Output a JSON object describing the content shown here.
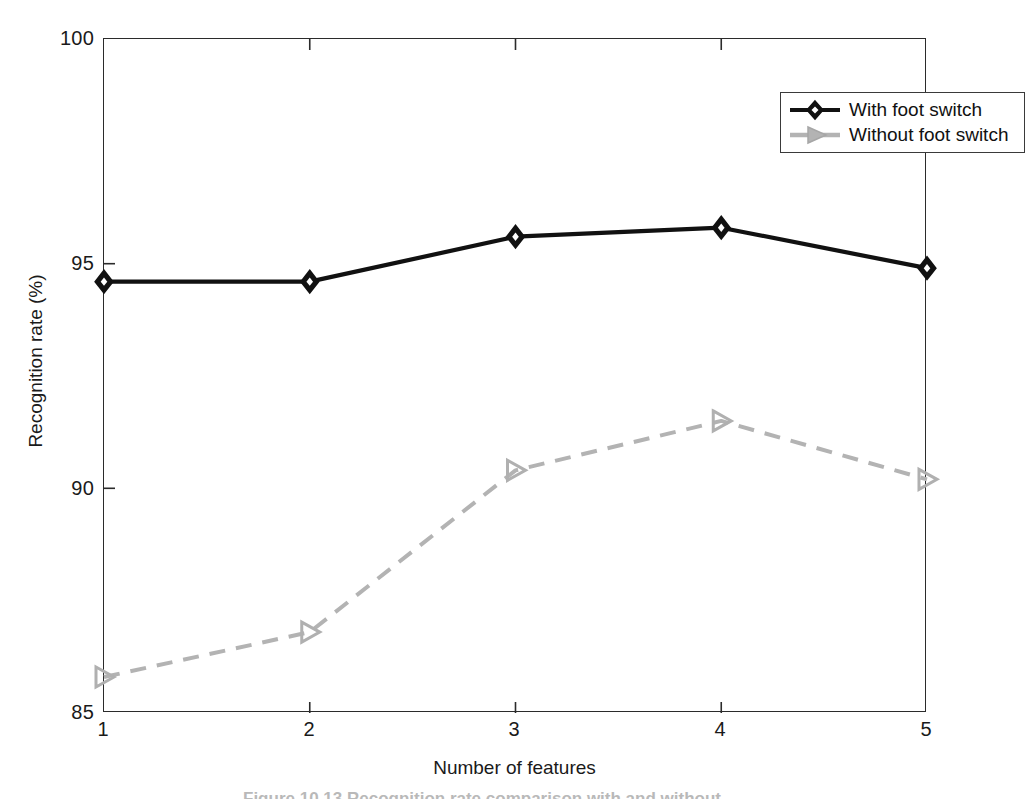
{
  "chart_data": {
    "type": "line",
    "title": "",
    "xlabel": "Number of features",
    "ylabel": "Recognition rate (%)",
    "x": [
      1,
      2,
      3,
      4,
      5
    ],
    "xtick_labels": [
      "1",
      "2",
      "3",
      "4",
      "5"
    ],
    "ytick_labels": [
      "85",
      "90",
      "95",
      "100"
    ],
    "yticks": [
      85,
      90,
      95,
      100
    ],
    "xlim": [
      1,
      5
    ],
    "ylim": [
      85,
      100
    ],
    "grid": false,
    "legend_position": "top-right",
    "series": [
      {
        "name": "With foot switch",
        "values": [
          94.6,
          94.6,
          95.6,
          95.8,
          94.9
        ],
        "color": "#111111",
        "linestyle": "solid",
        "marker": "diamond-filled"
      },
      {
        "name": "Without foot switch",
        "values": [
          85.8,
          86.8,
          90.4,
          91.5,
          90.2
        ],
        "color": "#b0b0b0",
        "linestyle": "dashed",
        "marker": "triangle-right-open"
      }
    ]
  },
  "axes": {
    "x_title": "Number of features",
    "y_title": "Recognition rate (%)",
    "x_ticks": [
      "1",
      "2",
      "3",
      "4",
      "5"
    ],
    "y_ticks": [
      "100",
      "95",
      "90",
      "85"
    ]
  },
  "legend": {
    "entries": [
      {
        "label": "With foot switch",
        "marker": "diamond-filled",
        "color": "#111111"
      },
      {
        "label": "Without foot switch",
        "marker": "triangle-right-open",
        "color": "#b0b0b0"
      }
    ]
  },
  "caption": {
    "text": "Figure  10.13   Recognition rate comparison with and without"
  }
}
